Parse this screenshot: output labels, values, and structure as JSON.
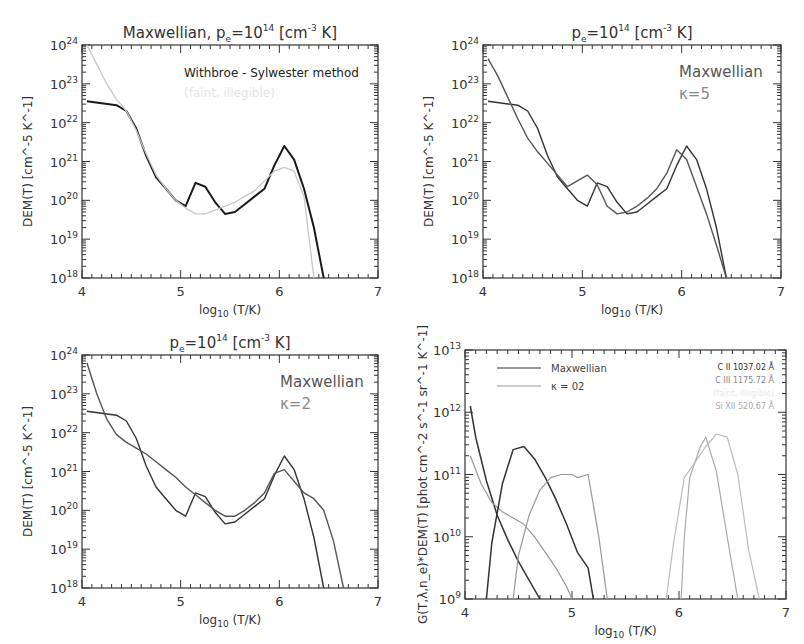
{
  "chart_data": [
    {
      "type": "line",
      "title": "Maxwellian, p_e=10^14 [cm^-3 K]",
      "title_parts": {
        "pre": "Maxwellian,  p",
        "sub": "e",
        "mid": "=10",
        "sup": "14",
        "post": " [cm",
        "sup2": "-3",
        "post2": " K]"
      },
      "xlabel": "log10 (T/K)",
      "ylabel": "DEM(T) [cm^-5 K^-1]",
      "xlim": [
        4,
        7
      ],
      "ylim_log10": [
        18,
        24
      ],
      "x_ticks": [
        "4",
        "5",
        "6",
        "7"
      ],
      "y_ticks": [
        "18",
        "19",
        "20",
        "21",
        "22",
        "23",
        "24"
      ],
      "legend": [
        {
          "label": "Withbroe - Sylwester method",
          "color": "#222222"
        },
        {
          "label": "(faint, illegible)",
          "color": "#e4e4e4"
        }
      ],
      "series": [
        {
          "name": "Withbroe - Sylwester method",
          "color": "#1a1a1a",
          "width": 2,
          "x": [
            4.05,
            4.35,
            4.45,
            4.55,
            4.65,
            4.75,
            4.85,
            4.95,
            5.05,
            5.15,
            5.25,
            5.35,
            5.45,
            5.55,
            5.65,
            5.75,
            5.85,
            5.95,
            6.05,
            6.15,
            6.25,
            6.35,
            6.45
          ],
          "log_y": [
            22.55,
            22.45,
            22.3,
            21.85,
            21.15,
            20.6,
            20.3,
            20.0,
            19.85,
            20.45,
            20.35,
            19.95,
            19.65,
            19.7,
            19.9,
            20.1,
            20.3,
            20.9,
            21.4,
            21.05,
            20.3,
            19.3,
            18.0
          ]
        },
        {
          "name": "second method (gray)",
          "color": "#c8c8c8",
          "width": 1.3,
          "x": [
            4.05,
            4.15,
            4.25,
            4.35,
            4.45,
            4.55,
            4.65,
            4.75,
            4.85,
            4.95,
            5.05,
            5.15,
            5.25,
            5.35,
            5.45,
            5.55,
            5.65,
            5.75,
            5.85,
            5.95,
            6.05,
            6.15,
            6.25,
            6.35
          ],
          "log_y": [
            24.0,
            23.5,
            23.0,
            22.6,
            22.3,
            21.8,
            21.2,
            20.65,
            20.3,
            20.0,
            19.8,
            19.65,
            19.65,
            19.75,
            19.85,
            19.95,
            20.1,
            20.25,
            20.5,
            20.75,
            20.85,
            20.75,
            20.1,
            18.0
          ]
        }
      ]
    },
    {
      "type": "line",
      "title": "p_e=10^14 [cm^-3 K]",
      "title_parts": {
        "pre": "p",
        "sub": "e",
        "mid": "=10",
        "sup": "14",
        "post": " [cm",
        "sup2": "-3",
        "post2": " K]"
      },
      "xlabel": "log10 (T/K)",
      "ylabel": "DEM(T) [cm^-5 K^-1]",
      "xlim": [
        4,
        7
      ],
      "ylim_log10": [
        18,
        24
      ],
      "x_ticks": [
        "4",
        "5",
        "6",
        "7"
      ],
      "y_ticks": [
        "18",
        "19",
        "20",
        "21",
        "22",
        "23",
        "24"
      ],
      "legend": [
        {
          "label": "Maxwellian",
          "color": "#555555"
        },
        {
          "label": "κ=5",
          "color": "#888888"
        }
      ],
      "series": [
        {
          "name": "Maxwellian",
          "color": "#333333",
          "width": 1.4,
          "x": [
            4.05,
            4.35,
            4.45,
            4.55,
            4.65,
            4.75,
            4.85,
            4.95,
            5.05,
            5.15,
            5.25,
            5.35,
            5.45,
            5.55,
            5.65,
            5.75,
            5.85,
            5.95,
            6.05,
            6.15,
            6.25,
            6.35,
            6.45
          ],
          "log_y": [
            22.55,
            22.45,
            22.3,
            21.85,
            21.15,
            20.6,
            20.3,
            20.0,
            19.85,
            20.45,
            20.35,
            19.95,
            19.65,
            19.7,
            19.9,
            20.1,
            20.3,
            20.9,
            21.4,
            21.05,
            20.3,
            19.3,
            18.0
          ]
        },
        {
          "name": "κ=5",
          "color": "#555555",
          "width": 1.4,
          "x": [
            4.05,
            4.15,
            4.25,
            4.35,
            4.45,
            4.55,
            4.65,
            4.75,
            4.85,
            4.95,
            5.05,
            5.15,
            5.25,
            5.35,
            5.45,
            5.55,
            5.65,
            5.75,
            5.85,
            5.95,
            6.05,
            6.15,
            6.25,
            6.35,
            6.45
          ],
          "log_y": [
            23.65,
            23.2,
            22.65,
            22.1,
            21.6,
            21.25,
            20.95,
            20.65,
            20.35,
            20.5,
            20.65,
            20.4,
            19.85,
            19.65,
            19.7,
            19.85,
            20.05,
            20.3,
            20.7,
            21.3,
            21.05,
            20.35,
            19.65,
            18.85,
            18.0
          ]
        }
      ]
    },
    {
      "type": "line",
      "title": "p_e=10^14 [cm^-3 K]",
      "title_parts": {
        "pre": "p",
        "sub": "e",
        "mid": "=10",
        "sup": "14",
        "post": " [cm",
        "sup2": "-3",
        "post2": " K]"
      },
      "xlabel": "log10 (T/K)",
      "ylabel": "DEM(T) [cm^-5 K^-1]",
      "xlim": [
        4,
        7
      ],
      "ylim_log10": [
        18,
        24
      ],
      "x_ticks": [
        "4",
        "5",
        "6",
        "7"
      ],
      "y_ticks": [
        "18",
        "19",
        "20",
        "21",
        "22",
        "23",
        "24"
      ],
      "legend": [
        {
          "label": "Maxwellian",
          "color": "#555555"
        },
        {
          "label": "κ=2",
          "color": "#888888"
        }
      ],
      "series": [
        {
          "name": "Maxwellian",
          "color": "#333333",
          "width": 1.4,
          "x": [
            4.05,
            4.35,
            4.45,
            4.55,
            4.65,
            4.75,
            4.85,
            4.95,
            5.05,
            5.15,
            5.25,
            5.35,
            5.45,
            5.55,
            5.65,
            5.75,
            5.85,
            5.95,
            6.05,
            6.15,
            6.25,
            6.35,
            6.45
          ],
          "log_y": [
            22.55,
            22.45,
            22.3,
            21.85,
            21.15,
            20.6,
            20.3,
            20.0,
            19.85,
            20.45,
            20.35,
            19.95,
            19.65,
            19.7,
            19.9,
            20.1,
            20.3,
            20.9,
            21.4,
            21.05,
            20.3,
            19.3,
            18.0
          ]
        },
        {
          "name": "κ=2",
          "color": "#555555",
          "width": 1.4,
          "x": [
            4.05,
            4.15,
            4.25,
            4.35,
            4.45,
            4.55,
            4.65,
            4.75,
            4.85,
            4.95,
            5.05,
            5.15,
            5.25,
            5.35,
            5.45,
            5.55,
            5.65,
            5.75,
            5.85,
            5.95,
            6.05,
            6.15,
            6.25,
            6.35,
            6.45,
            6.55,
            6.65
          ],
          "log_y": [
            23.8,
            23.0,
            22.35,
            21.95,
            21.75,
            21.6,
            21.45,
            21.25,
            21.05,
            20.85,
            20.6,
            20.4,
            20.2,
            20.0,
            19.85,
            19.85,
            20.0,
            20.2,
            20.45,
            20.95,
            21.05,
            20.75,
            20.45,
            20.3,
            20.0,
            19.2,
            18.0
          ]
        }
      ]
    },
    {
      "type": "line",
      "title": "",
      "xlabel": "log10 (T/K)",
      "ylabel": "G(T,λ,n_e)*DEM(T) [phot cm^-2 s^-1 sr^-1 K^-1]",
      "xlim": [
        4,
        7
      ],
      "ylim_log10": [
        9,
        13
      ],
      "x_ticks": [
        "4",
        "5",
        "6",
        "7"
      ],
      "y_ticks": [
        "9",
        "10",
        "11",
        "12",
        "13"
      ],
      "legend": [
        {
          "label": "Maxwellian",
          "color": "#333333"
        },
        {
          "label": "κ = 02",
          "color": "#999999"
        }
      ],
      "line_labels": [
        {
          "label": "C II 1037.02 Å",
          "color": "#333333"
        },
        {
          "label": "C III 1175.72 Å",
          "color": "#888888"
        },
        {
          "label": "(faint, illegible)",
          "color": "#e8e8e8"
        },
        {
          "label": "Si XII 520.67 Å",
          "color": "#aaaaaa"
        }
      ],
      "series": [
        {
          "name": "C II Maxwellian",
          "color": "#333333",
          "width": 1.5,
          "x": [
            4.05,
            4.1,
            4.2,
            4.3,
            4.4,
            4.5,
            4.6,
            4.7
          ],
          "log_y": [
            12.1,
            11.6,
            10.9,
            10.35,
            9.95,
            9.6,
            9.3,
            9.0
          ]
        },
        {
          "name": "C II κ=02",
          "color": "#999999",
          "width": 1.2,
          "x": [
            4.05,
            4.15,
            4.25,
            4.35,
            4.45,
            4.55,
            4.65,
            4.75,
            4.85,
            4.95,
            5.0
          ],
          "log_y": [
            11.3,
            10.85,
            10.55,
            10.4,
            10.3,
            10.2,
            10.0,
            9.75,
            9.5,
            9.2,
            9.0
          ]
        },
        {
          "name": "C III Maxwellian",
          "color": "#333333",
          "width": 1.5,
          "x": [
            4.2,
            4.25,
            4.35,
            4.45,
            4.55,
            4.65,
            4.75,
            4.85,
            4.95,
            5.05,
            5.15,
            5.2
          ],
          "log_y": [
            9.0,
            9.9,
            10.85,
            11.4,
            11.45,
            11.25,
            10.95,
            10.6,
            10.2,
            9.75,
            9.5,
            9.0
          ]
        },
        {
          "name": "C III κ=02",
          "color": "#999999",
          "width": 1.2,
          "x": [
            4.45,
            4.5,
            4.6,
            4.7,
            4.8,
            4.9,
            5.0,
            5.05,
            5.15,
            5.25,
            5.33
          ],
          "log_y": [
            9.0,
            9.7,
            10.35,
            10.75,
            10.95,
            11.0,
            11.0,
            10.95,
            11.0,
            10.0,
            9.0
          ]
        },
        {
          "name": "Si XII Maxwellian",
          "color": "#aaaaaa",
          "width": 1.2,
          "x": [
            6.02,
            6.05,
            6.1,
            6.2,
            6.25,
            6.35,
            6.45,
            6.55
          ],
          "log_y": [
            9.0,
            10.0,
            10.95,
            11.45,
            11.6,
            11.05,
            10.0,
            9.0
          ]
        },
        {
          "name": "Si XII κ=02",
          "color": "#bbbbbb",
          "width": 1.2,
          "x": [
            5.88,
            5.95,
            6.05,
            6.15,
            6.25,
            6.35,
            6.45,
            6.55,
            6.65,
            6.75
          ],
          "log_y": [
            9.0,
            9.9,
            10.95,
            11.2,
            11.45,
            11.65,
            11.6,
            11.0,
            9.8,
            9.0
          ]
        }
      ]
    }
  ],
  "panels": [
    {
      "x0": 82,
      "y0": 45,
      "x1": 378,
      "y1": 278
    },
    {
      "x0": 483,
      "y0": 45,
      "x1": 781,
      "y1": 278
    },
    {
      "x0": 82,
      "y0": 355,
      "x1": 378,
      "y1": 588
    },
    {
      "x0": 465,
      "y0": 350,
      "x1": 786,
      "y1": 599
    }
  ]
}
